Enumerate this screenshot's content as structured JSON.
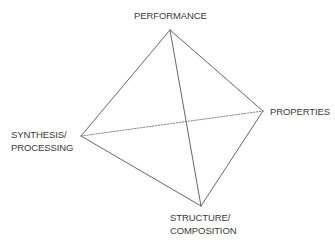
{
  "diagram": {
    "type": "materials-science-tetrahedron",
    "vertices": {
      "top": {
        "label": "PERFORMANCE",
        "x": 170,
        "y": 30
      },
      "right": {
        "label": "PROPERTIES",
        "x": 263,
        "y": 111
      },
      "left": {
        "label_lines": [
          "SYNTHESIS/",
          "PROCESSING"
        ],
        "x": 81,
        "y": 136
      },
      "bottom": {
        "label_lines": [
          "STRUCTURE/",
          "COMPOSITION"
        ],
        "x": 201,
        "y": 206
      }
    },
    "edges": [
      {
        "from": "top",
        "to": "left",
        "style": "solid"
      },
      {
        "from": "top",
        "to": "right",
        "style": "solid"
      },
      {
        "from": "top",
        "to": "bottom",
        "style": "solid"
      },
      {
        "from": "left",
        "to": "bottom",
        "style": "solid"
      },
      {
        "from": "right",
        "to": "bottom",
        "style": "solid"
      },
      {
        "from": "left",
        "to": "right",
        "style": "dotted"
      }
    ],
    "colors": {
      "line": "#555555",
      "text": "#3a3a3a",
      "background": "#ffffff"
    }
  }
}
